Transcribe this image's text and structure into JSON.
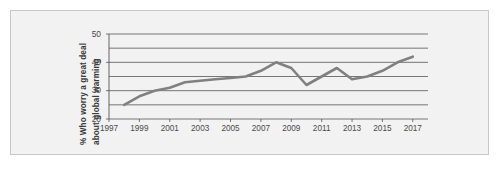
{
  "chart_data": {
    "type": "line",
    "title": "",
    "subtitle": "",
    "xlabel": "",
    "ylabel": "% Who worry a great deal about global warming",
    "ylabel_lines": [
      "% Who worry a great deal",
      "about global warming"
    ],
    "x": [
      1998,
      1999,
      2000,
      2001,
      2002,
      2003,
      2004,
      2005,
      2006,
      2007,
      2008,
      2009,
      2010,
      2011,
      2012,
      2013,
      2014,
      2015,
      2016,
      2017
    ],
    "values": [
      25,
      28,
      30,
      31,
      33,
      33.5,
      34,
      34.5,
      35,
      37,
      40,
      38,
      32,
      35,
      38,
      34,
      35,
      37,
      40,
      42
    ],
    "series": [
      {
        "name": "% Who worry a great deal about global warming",
        "color": "#808080",
        "values": [
          25,
          28,
          30,
          31,
          33,
          33.5,
          34,
          34.5,
          35,
          37,
          40,
          38,
          32,
          35,
          38,
          34,
          35,
          37,
          40,
          42
        ]
      }
    ],
    "xlim": [
      1997,
      2018
    ],
    "ylim": [
      20,
      50
    ],
    "ytick_labels": [
      "50",
      "40",
      "30",
      "20"
    ],
    "yticks": [
      50,
      40,
      30,
      20
    ],
    "gridlines_y": [
      50,
      45,
      40,
      35,
      30,
      25,
      20
    ],
    "xtick_labels": [
      "1997",
      "1999",
      "2001",
      "2003",
      "2005",
      "2007",
      "2009",
      "2011",
      "2013",
      "2015",
      "2017"
    ],
    "xticks": [
      1997,
      1999,
      2001,
      2003,
      2005,
      2007,
      2009,
      2011,
      2013,
      2015,
      2017
    ],
    "grid": true,
    "legend": false,
    "legend_position": "none",
    "annotations": []
  },
  "style": {
    "line_color": "#808080",
    "grid_color": "#555555",
    "axis_color": "#555555",
    "plot_background": "#f2f2f2",
    "frame_border": "#c8c8c8",
    "text_color": "#4a4a4a",
    "title_color": "#3a3a3a"
  }
}
